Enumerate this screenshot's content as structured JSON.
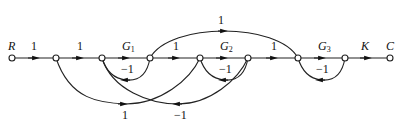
{
  "diagram": {
    "type": "signal-flow-graph",
    "nodes": [
      {
        "id": "n0",
        "x": 12,
        "y": 58,
        "label": "R"
      },
      {
        "id": "n1",
        "x": 56,
        "y": 58,
        "label": ""
      },
      {
        "id": "n2",
        "x": 102,
        "y": 58,
        "label": ""
      },
      {
        "id": "n3",
        "x": 150,
        "y": 58,
        "label": ""
      },
      {
        "id": "n4",
        "x": 200,
        "y": 58,
        "label": ""
      },
      {
        "id": "n5",
        "x": 248,
        "y": 58,
        "label": ""
      },
      {
        "id": "n6",
        "x": 298,
        "y": 58,
        "label": ""
      },
      {
        "id": "n7",
        "x": 345,
        "y": 58,
        "label": ""
      },
      {
        "id": "n8",
        "x": 390,
        "y": 58,
        "label": "C"
      }
    ],
    "forward_branches": [
      {
        "from": "n0",
        "to": "n1",
        "gain": "1"
      },
      {
        "from": "n1",
        "to": "n2",
        "gain": "1"
      },
      {
        "from": "n2",
        "to": "n3",
        "gain": "G",
        "sub": "1"
      },
      {
        "from": "n3",
        "to": "n4",
        "gain": "1"
      },
      {
        "from": "n4",
        "to": "n5",
        "gain": "G",
        "sub": "2"
      },
      {
        "from": "n5",
        "to": "n6",
        "gain": "1"
      },
      {
        "from": "n6",
        "to": "n7",
        "gain": "G",
        "sub": "3"
      },
      {
        "from": "n7",
        "to": "n8",
        "gain": "K"
      }
    ],
    "feedback_loops": [
      {
        "from": "n3",
        "to": "n2",
        "gain": "−1"
      },
      {
        "from": "n5",
        "to": "n4",
        "gain": "−1"
      },
      {
        "from": "n7",
        "to": "n6",
        "gain": "−1"
      }
    ],
    "long_branches": [
      {
        "from": "n3",
        "to": "n6",
        "gain": "1",
        "position": "top"
      },
      {
        "from": "n1",
        "to": "n4",
        "gain": "1",
        "position": "bottom"
      },
      {
        "from": "n5",
        "to": "n2",
        "gain": "−1",
        "position": "bottom"
      }
    ]
  },
  "labels": {
    "R": "R",
    "C": "C",
    "K": "K",
    "G": "G",
    "g1": "1",
    "g2": "2",
    "g3": "3",
    "one": "1",
    "minus_one": "−1"
  }
}
